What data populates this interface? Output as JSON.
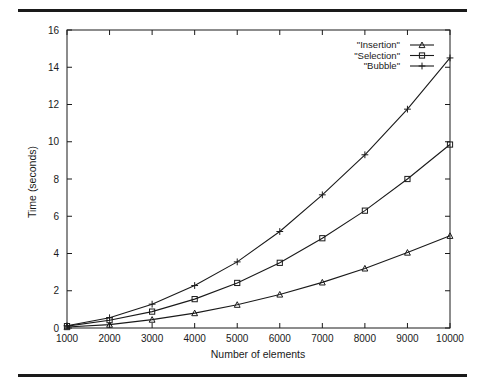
{
  "figure": {
    "name": "sorting-algorithm-benchmark-plot",
    "background_color": "#ffffff",
    "ink_color": "#1a1a1a",
    "top_rule": true,
    "bottom_rule": true
  },
  "chart_data": {
    "type": "line",
    "title": "",
    "xlabel": "Number of elements",
    "ylabel": "Time (seconds)",
    "x": [
      1000,
      2000,
      3000,
      4000,
      5000,
      6000,
      7000,
      8000,
      9000,
      10000
    ],
    "xlim": [
      1000,
      10000
    ],
    "ylim": [
      0,
      16
    ],
    "xticks": [
      1000,
      2000,
      3000,
      4000,
      5000,
      6000,
      7000,
      8000,
      9000,
      10000
    ],
    "yticks": [
      0,
      2,
      4,
      6,
      8,
      10,
      12,
      14,
      16
    ],
    "xtick_labels": [
      "1000",
      "2000",
      "3000",
      "4000",
      "5000",
      "6000",
      "7000",
      "8000",
      "9000",
      "10000"
    ],
    "ytick_labels": [
      "0",
      "2",
      "4",
      "6",
      "8",
      "10",
      "12",
      "14",
      "16"
    ],
    "grid": false,
    "legend_position": "top-right",
    "series": [
      {
        "name": "\"Insertion\"",
        "marker": "triangle",
        "values": [
          0.05,
          0.18,
          0.45,
          0.8,
          1.25,
          1.8,
          2.45,
          3.2,
          4.05,
          4.95
        ]
      },
      {
        "name": "\"Selection\"",
        "marker": "square",
        "values": [
          0.1,
          0.42,
          0.88,
          1.55,
          2.42,
          3.5,
          4.82,
          6.3,
          8.0,
          9.85
        ]
      },
      {
        "name": "\"Bubble\"",
        "marker": "cross",
        "values": [
          0.12,
          0.55,
          1.28,
          2.28,
          3.55,
          5.18,
          7.15,
          9.3,
          11.75,
          14.5
        ]
      }
    ]
  }
}
